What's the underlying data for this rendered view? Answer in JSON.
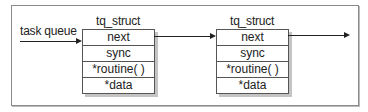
{
  "diagram": {
    "start_label": "task queue",
    "structs": [
      {
        "title": "tq_struct",
        "fields": [
          "next",
          "sync",
          "*routine( )",
          "*data"
        ]
      },
      {
        "title": "tq_struct",
        "fields": [
          "next",
          "sync",
          "*routine( )",
          "*data"
        ]
      }
    ],
    "colors": {
      "line": "#222222",
      "frame": "#8a8a8a",
      "shadow": "#c4c4c4"
    }
  }
}
